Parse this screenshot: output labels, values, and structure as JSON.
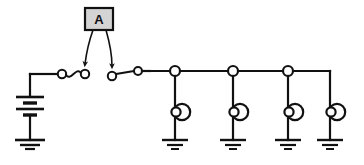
{
  "diagram": {
    "background_color": "#ffffff",
    "line_color": "#111111",
    "annotation": {
      "label": "A",
      "box_fill": "#d4d4d4",
      "box_stroke": "#111111",
      "points_to": [
        "switch-1-right-contact",
        "switch-2-left-contact"
      ],
      "arrow_count": 2
    },
    "source": {
      "kind": "battery",
      "name": "battery",
      "plate_count": 4,
      "grounded": true,
      "ground_bars": 3
    },
    "switches": [
      {
        "name": "switch-1",
        "state": "closed",
        "blade_style": "wavy",
        "terminals": 2
      },
      {
        "name": "switch-2",
        "state": "open",
        "blade_style": "straight",
        "terminals": 2
      }
    ],
    "bus": {
      "name": "distribution-bus",
      "orientation": "horizontal",
      "junction_nodes": 3
    },
    "loads": [
      {
        "name": "load-1",
        "symbol": "bell-circle",
        "grounded": true,
        "ground_bars": 3
      },
      {
        "name": "load-2",
        "symbol": "bell-circle",
        "grounded": true,
        "ground_bars": 3
      },
      {
        "name": "load-3",
        "symbol": "bell-circle",
        "grounded": true,
        "ground_bars": 3
      },
      {
        "name": "load-4",
        "symbol": "bell-circle",
        "grounded": true,
        "ground_bars": 3
      }
    ]
  }
}
